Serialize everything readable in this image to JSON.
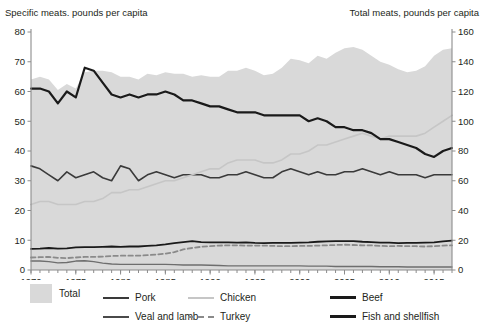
{
  "left_axis_title": "Specific meats. pounds per capita",
  "right_axis_title": "Total meats, pounds per capita",
  "chart_data": {
    "type": "line",
    "title": "",
    "xlabel": "",
    "ylabel": "Specific meats. pounds per capita",
    "y2label": "Total meats, pounds per capita",
    "xlim": [
      1970,
      2017
    ],
    "ylim": [
      0,
      80
    ],
    "y2lim": [
      0,
      160
    ],
    "yticks": [
      0,
      10,
      20,
      30,
      40,
      50,
      60,
      70,
      80
    ],
    "y2ticks": [
      0,
      20,
      40,
      60,
      80,
      100,
      120,
      140,
      160
    ],
    "xticks_labeled": [
      1970,
      1975,
      1980,
      1985,
      1990,
      1995,
      2000,
      2005,
      2010,
      2015
    ],
    "xticks_minor_interval": 1,
    "grid": false,
    "legend_position": "bottom",
    "x": [
      1970,
      1971,
      1972,
      1973,
      1974,
      1975,
      1976,
      1977,
      1978,
      1979,
      1980,
      1981,
      1982,
      1983,
      1984,
      1985,
      1986,
      1987,
      1988,
      1989,
      1990,
      1991,
      1992,
      1993,
      1994,
      1995,
      1996,
      1997,
      1998,
      1999,
      2000,
      2001,
      2002,
      2003,
      2004,
      2005,
      2006,
      2007,
      2008,
      2009,
      2010,
      2011,
      2012,
      2013,
      2014,
      2015,
      2016,
      2017
    ],
    "series": [
      {
        "name": "Total",
        "axis": "right",
        "kind": "area",
        "color": "#d9d9d9",
        "values": [
          128,
          130,
          128,
          121,
          125,
          122,
          133,
          134,
          134,
          133,
          130,
          130,
          128,
          132,
          131,
          133,
          132,
          132,
          130,
          131,
          130,
          130,
          134,
          134,
          136,
          134,
          131,
          132,
          136,
          142,
          141,
          139,
          144,
          142,
          146,
          149,
          150,
          148,
          144,
          140,
          138,
          135,
          133,
          134,
          137,
          144,
          148,
          149
        ]
      },
      {
        "name": "Pork",
        "axis": "left",
        "kind": "line",
        "color": "#3a3a3a",
        "width": 1.6,
        "values": [
          35,
          34,
          32,
          30,
          33,
          31,
          32,
          33,
          31,
          30,
          35,
          34,
          30,
          32,
          33,
          32,
          31,
          32,
          32,
          32,
          31,
          31,
          32,
          32,
          33,
          32,
          31,
          31,
          33,
          34,
          33,
          32,
          33,
          32,
          32,
          33,
          33,
          34,
          33,
          32,
          33,
          32,
          32,
          32,
          31,
          32,
          32,
          32
        ]
      },
      {
        "name": "Chicken",
        "axis": "left",
        "kind": "line",
        "color": "#c6c6c6",
        "width": 1.6,
        "values": [
          22,
          23,
          23,
          22,
          22,
          22,
          23,
          23,
          24,
          26,
          26,
          27,
          27,
          28,
          29,
          30,
          30,
          31,
          32,
          33,
          34,
          34,
          36,
          37,
          37,
          37,
          36,
          36,
          37,
          39,
          39,
          40,
          42,
          42,
          43,
          44,
          45,
          46,
          45,
          44,
          45,
          45,
          45,
          45,
          46,
          48,
          50,
          52
        ]
      },
      {
        "name": "Beef",
        "axis": "left",
        "kind": "line",
        "color": "#1a1a1a",
        "width": 2.2,
        "values": [
          61,
          61,
          60,
          56,
          60,
          58,
          68,
          67,
          63,
          59,
          58,
          59,
          58,
          59,
          59,
          60,
          59,
          57,
          57,
          56,
          55,
          55,
          54,
          53,
          53,
          53,
          52,
          52,
          52,
          52,
          52,
          50,
          51,
          50,
          48,
          48,
          47,
          47,
          46,
          44,
          44,
          43,
          42,
          41,
          39,
          38,
          40,
          41
        ]
      },
      {
        "name": "Veal and lamb",
        "axis": "left",
        "kind": "line",
        "color": "#6e6e6e",
        "width": 1.4,
        "values": [
          3.0,
          3.0,
          2.8,
          2.4,
          2.5,
          3.0,
          3.1,
          2.8,
          2.3,
          2.0,
          1.9,
          1.9,
          1.9,
          1.9,
          1.9,
          1.9,
          1.8,
          1.7,
          1.7,
          1.7,
          1.6,
          1.5,
          1.4,
          1.4,
          1.4,
          1.4,
          1.4,
          1.4,
          1.4,
          1.4,
          1.4,
          1.3,
          1.3,
          1.3,
          1.2,
          1.2,
          1.2,
          1.2,
          1.2,
          1.1,
          1.1,
          1.1,
          1.0,
          1.0,
          1.0,
          1.0,
          1.0,
          1.0
        ]
      },
      {
        "name": "Turkey",
        "axis": "left",
        "kind": "dashed-line",
        "color": "#8a8a8a",
        "width": 1.8,
        "values": [
          4.2,
          4.3,
          4.4,
          4.1,
          4.0,
          4.2,
          4.4,
          4.4,
          4.5,
          4.7,
          4.8,
          4.8,
          4.8,
          5.0,
          5.2,
          5.5,
          6.0,
          6.9,
          7.4,
          7.8,
          8.0,
          8.2,
          8.3,
          8.3,
          8.2,
          8.2,
          8.2,
          8.1,
          8.0,
          8.0,
          8.1,
          8.1,
          8.2,
          8.3,
          8.4,
          8.5,
          8.4,
          8.3,
          8.3,
          8.1,
          8.0,
          8.1,
          8.0,
          8.0,
          7.9,
          8.0,
          8.2,
          8.3
        ]
      },
      {
        "name": "Fish and shellfish",
        "axis": "left",
        "kind": "line",
        "color": "#1a1a1a",
        "width": 1.8,
        "values": [
          7.1,
          7.2,
          7.4,
          7.2,
          7.3,
          7.6,
          7.7,
          7.7,
          7.8,
          7.9,
          7.8,
          7.9,
          7.9,
          8.1,
          8.3,
          8.6,
          9.0,
          9.4,
          9.7,
          9.4,
          9.3,
          9.3,
          9.3,
          9.2,
          9.3,
          9.1,
          9.0,
          9.1,
          9.1,
          9.1,
          9.2,
          9.3,
          9.5,
          9.6,
          9.7,
          9.7,
          9.7,
          9.5,
          9.4,
          9.2,
          9.2,
          9.0,
          9.1,
          9.1,
          9.2,
          9.3,
          9.6,
          9.9
        ]
      }
    ]
  },
  "legend": {
    "items": [
      {
        "label": "Total",
        "marker": "area"
      },
      {
        "label": "Pork",
        "marker": "line"
      },
      {
        "label": "Chicken",
        "marker": "line"
      },
      {
        "label": "Beef",
        "marker": "line"
      },
      {
        "label": "Veal and lamb",
        "marker": "line"
      },
      {
        "label": "Turkey",
        "marker": "dashed"
      },
      {
        "label": "Fish and shellfish",
        "marker": "line"
      }
    ]
  }
}
